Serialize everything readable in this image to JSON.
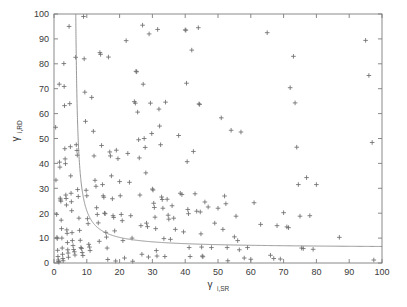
{
  "figure": {
    "width": 407,
    "height": 307,
    "background": "#ffffff"
  },
  "axes": {
    "left": 54,
    "right": 382,
    "top": 14,
    "bottom": 263,
    "frame_color": "#7d7d7d",
    "tick_direction": "in",
    "tick_length": 4
  },
  "chart_data": {
    "type": "scatter",
    "title": "",
    "xlabel": "γ",
    "xlabel_sub": "i,SR",
    "ylabel": "γ",
    "ylabel_sub": "i,RD",
    "xlim": [
      0,
      100
    ],
    "ylim": [
      0,
      100
    ],
    "xticks": [
      0,
      10,
      20,
      30,
      40,
      50,
      60,
      70,
      80,
      90,
      100
    ],
    "yticks": [
      0,
      10,
      20,
      30,
      40,
      50,
      60,
      70,
      80,
      90,
      100
    ],
    "xticklabels": [
      "0",
      "10",
      "20",
      "30",
      "40",
      "50",
      "60",
      "70",
      "80",
      "90",
      "100"
    ],
    "yticklabels": [
      "0",
      "10",
      "20",
      "30",
      "40",
      "50",
      "60",
      "70",
      "80",
      "90",
      "100"
    ],
    "grid": false,
    "legend": null,
    "marker": {
      "symbol": "+",
      "color": "#6e6e6e",
      "size": 4.6
    },
    "series": [
      {
        "name": "samples",
        "marker": "+",
        "color": "#6e6e6e",
        "points": [
          [
            0.5,
            54.5
          ],
          [
            0.6,
            33.3
          ],
          [
            0.8,
            19.5
          ],
          [
            0.9,
            10.3
          ],
          [
            1.0,
            9.8
          ],
          [
            1.1,
            5.1
          ],
          [
            1.2,
            2.6
          ],
          [
            1.3,
            1.2
          ],
          [
            1.4,
            0.6
          ],
          [
            1.5,
            0.3
          ],
          [
            1.6,
            71.8
          ],
          [
            1.7,
            40.5
          ],
          [
            1.8,
            38.5
          ],
          [
            1.9,
            26.0
          ],
          [
            2.0,
            25.3
          ],
          [
            2.1,
            24.8
          ],
          [
            2.2,
            17.2
          ],
          [
            2.3,
            13.8
          ],
          [
            2.4,
            10.0
          ],
          [
            2.5,
            6.0
          ],
          [
            2.6,
            3.5
          ],
          [
            2.7,
            1.8
          ],
          [
            2.8,
            0.9
          ],
          [
            3.0,
            80.1
          ],
          [
            3.1,
            70.9
          ],
          [
            3.2,
            63.2
          ],
          [
            3.3,
            45.9
          ],
          [
            3.4,
            41.8
          ],
          [
            3.5,
            39.9
          ],
          [
            3.6,
            27.3
          ],
          [
            3.7,
            25.9
          ],
          [
            3.8,
            23.3
          ],
          [
            3.9,
            13.3
          ],
          [
            4.0,
            11.9
          ],
          [
            4.1,
            8.2
          ],
          [
            4.2,
            5.3
          ],
          [
            4.3,
            4.0
          ],
          [
            4.4,
            2.3
          ],
          [
            4.6,
            95.0
          ],
          [
            4.8,
            64.0
          ],
          [
            5.0,
            46.7
          ],
          [
            5.1,
            35.0
          ],
          [
            5.2,
            28.0
          ],
          [
            5.3,
            24.6
          ],
          [
            5.4,
            21.0
          ],
          [
            5.5,
            12.2
          ],
          [
            5.6,
            9.0
          ],
          [
            5.8,
            7.0
          ],
          [
            6.0,
            5.4
          ],
          [
            6.2,
            4.5
          ],
          [
            6.4,
            3.2
          ],
          [
            6.6,
            82.6
          ],
          [
            6.8,
            47.5
          ],
          [
            7.0,
            45.2
          ],
          [
            7.1,
            43.3
          ],
          [
            7.2,
            29.5
          ],
          [
            7.4,
            26.7
          ],
          [
            7.6,
            18.0
          ],
          [
            7.8,
            13.1
          ],
          [
            8.0,
            9.1
          ],
          [
            8.2,
            6.2
          ],
          [
            8.4,
            5.8
          ],
          [
            8.6,
            4.2
          ],
          [
            8.8,
            3.0
          ],
          [
            9.0,
            99.0
          ],
          [
            9.2,
            82.0
          ],
          [
            9.4,
            68.6
          ],
          [
            9.6,
            56.9
          ],
          [
            9.8,
            29.2
          ],
          [
            10.0,
            27.0
          ],
          [
            10.2,
            17.8
          ],
          [
            10.4,
            15.8
          ],
          [
            10.6,
            7.5
          ],
          [
            10.8,
            6.4
          ],
          [
            11.0,
            5.0
          ],
          [
            11.5,
            66.5
          ],
          [
            12.0,
            52.9
          ],
          [
            12.2,
            43.0
          ],
          [
            12.5,
            33.2
          ],
          [
            12.8,
            30.8
          ],
          [
            13.0,
            22.2
          ],
          [
            13.2,
            19.5
          ],
          [
            13.5,
            16.1
          ],
          [
            13.8,
            8.7
          ],
          [
            14.0,
            84.5
          ],
          [
            14.2,
            83.8
          ],
          [
            14.5,
            47.2
          ],
          [
            14.8,
            31.5
          ],
          [
            15.0,
            27.0
          ],
          [
            15.2,
            26.4
          ],
          [
            15.4,
            20.0
          ],
          [
            15.6,
            19.8
          ],
          [
            15.8,
            12.3
          ],
          [
            16.0,
            10.4
          ],
          [
            16.2,
            6.0
          ],
          [
            16.4,
            1.4
          ],
          [
            16.6,
            82.7
          ],
          [
            17.0,
            44.6
          ],
          [
            17.2,
            43.0
          ],
          [
            17.5,
            35.0
          ],
          [
            17.8,
            25.8
          ],
          [
            18.0,
            19.0
          ],
          [
            18.2,
            18.3
          ],
          [
            18.5,
            12.9
          ],
          [
            18.8,
            0.8
          ],
          [
            19.0,
            45.3
          ],
          [
            19.5,
            41.9
          ],
          [
            20.0,
            32.7
          ],
          [
            20.2,
            27.0
          ],
          [
            20.5,
            19.5
          ],
          [
            20.8,
            17.0
          ],
          [
            21.0,
            9.0
          ],
          [
            21.5,
            2.0
          ],
          [
            22.0,
            89.3
          ],
          [
            22.5,
            44.0
          ],
          [
            23.0,
            32.4
          ],
          [
            23.4,
            19.0
          ],
          [
            23.8,
            10.0
          ],
          [
            24.0,
            0.7
          ],
          [
            24.5,
            64.8
          ],
          [
            24.8,
            64.2
          ],
          [
            25.0,
            77.0
          ],
          [
            25.2,
            76.8
          ],
          [
            25.5,
            60.6
          ],
          [
            25.8,
            49.5
          ],
          [
            26.0,
            42.2
          ],
          [
            26.2,
            27.3
          ],
          [
            26.5,
            15.0
          ],
          [
            26.8,
            3.5
          ],
          [
            27.0,
            95.5
          ],
          [
            27.2,
            71.8
          ],
          [
            27.5,
            50.0
          ],
          [
            27.8,
            46.4
          ],
          [
            28.0,
            36.2
          ],
          [
            28.2,
            16.0
          ],
          [
            28.5,
            14.6
          ],
          [
            28.8,
            2.4
          ],
          [
            29.0,
            92.0
          ],
          [
            29.4,
            64.2
          ],
          [
            29.8,
            52.0
          ],
          [
            30.0,
            29.7
          ],
          [
            30.2,
            29.3
          ],
          [
            30.4,
            24.0
          ],
          [
            30.6,
            22.3
          ],
          [
            30.8,
            18.4
          ],
          [
            31.0,
            13.8
          ],
          [
            31.2,
            5.0
          ],
          [
            31.4,
            2.8
          ],
          [
            31.6,
            93.8
          ],
          [
            32.0,
            61.8
          ],
          [
            32.2,
            55.0
          ],
          [
            32.5,
            47.5
          ],
          [
            32.8,
            26.5
          ],
          [
            33.0,
            25.5
          ],
          [
            33.2,
            22.0
          ],
          [
            33.5,
            9.8
          ],
          [
            33.8,
            2.6
          ],
          [
            34.0,
            64.6
          ],
          [
            34.5,
            25.6
          ],
          [
            34.8,
            19.2
          ],
          [
            35.0,
            17.6
          ],
          [
            35.5,
            9.5
          ],
          [
            36.0,
            23.0
          ],
          [
            36.5,
            18.0
          ],
          [
            37.0,
            13.5
          ],
          [
            38.0,
            51.2
          ],
          [
            38.5,
            28.0
          ],
          [
            39.0,
            27.5
          ],
          [
            39.5,
            12.5
          ],
          [
            40.0,
            93.6
          ],
          [
            40.2,
            93.5
          ],
          [
            40.4,
            72.2
          ],
          [
            40.6,
            40.7
          ],
          [
            40.8,
            21.5
          ],
          [
            41.0,
            19.8
          ],
          [
            41.2,
            6.2
          ],
          [
            41.5,
            2.6
          ],
          [
            42.0,
            85.5
          ],
          [
            42.5,
            44.8
          ],
          [
            43.0,
            27.8
          ],
          [
            43.5,
            20.8
          ],
          [
            44.0,
            94.5
          ],
          [
            44.2,
            63.9
          ],
          [
            44.4,
            63.7
          ],
          [
            44.6,
            20.5
          ],
          [
            44.8,
            11.7
          ],
          [
            45.0,
            6.4
          ],
          [
            45.2,
            2.8
          ],
          [
            45.4,
            2.5
          ],
          [
            46.0,
            24.5
          ],
          [
            47.0,
            22.5
          ],
          [
            48.0,
            6.2
          ],
          [
            49.0,
            16.0
          ],
          [
            50.0,
            22.0
          ],
          [
            51.0,
            58.3
          ],
          [
            51.5,
            13.5
          ],
          [
            52.0,
            26.9
          ],
          [
            52.4,
            23.8
          ],
          [
            52.8,
            6.2
          ],
          [
            53.0,
            0.9
          ],
          [
            54.0,
            53.3
          ],
          [
            55.0,
            10.5
          ],
          [
            55.5,
            18.8
          ],
          [
            56.0,
            9.0
          ],
          [
            56.5,
            5.3
          ],
          [
            57.0,
            52.6
          ],
          [
            58.0,
            2.0
          ],
          [
            59.0,
            6.2
          ],
          [
            60.0,
            1.5
          ],
          [
            61.0,
            24.2
          ],
          [
            63.0,
            15.5
          ],
          [
            65.0,
            92.5
          ],
          [
            66.0,
            3.1
          ],
          [
            67.0,
            1.8
          ],
          [
            68.0,
            15.0
          ],
          [
            69.0,
            1.6
          ],
          [
            70.0,
            20.2
          ],
          [
            71.0,
            14.5
          ],
          [
            71.5,
            14.2
          ],
          [
            72.0,
            70.4
          ],
          [
            73.0,
            83.0
          ],
          [
            73.5,
            64.3
          ],
          [
            74.0,
            46.5
          ],
          [
            74.5,
            31.5
          ],
          [
            75.0,
            18.8
          ],
          [
            75.5,
            6.0
          ],
          [
            76.0,
            5.8
          ],
          [
            77.0,
            34.3
          ],
          [
            78.0,
            19.0
          ],
          [
            79.0,
            5.5
          ],
          [
            80.0,
            31.5
          ],
          [
            87.0,
            10.3
          ],
          [
            95.0,
            89.4
          ],
          [
            96.0,
            75.3
          ],
          [
            97.0,
            48.4
          ],
          [
            97.5,
            1.2
          ]
        ]
      }
    ],
    "curve": {
      "name": "outage-boundary",
      "color": "#8a8a8a",
      "description": "hyperbolic threshold boundary with vertical asymptote x≈6 and horizontal asymptote y≈6",
      "asymptote_x": 6.0,
      "asymptote_y": 6.0,
      "constant_k": 60.0
    }
  }
}
